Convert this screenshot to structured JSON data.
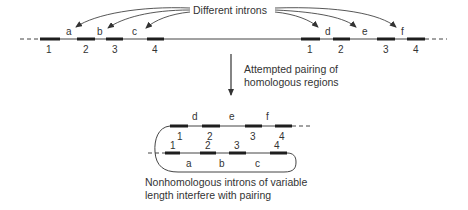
{
  "title_label": "Different introns",
  "step_arrow_text": [
    "Attempted pairing of",
    "homologous regions"
  ],
  "caption": [
    "Nonhomologous introns of variable",
    "length interfere with pairing"
  ],
  "gene_left": {
    "exons": [
      "1",
      "2",
      "3",
      "4"
    ],
    "introns": [
      "a",
      "b",
      "c"
    ]
  },
  "gene_right": {
    "exons": [
      "1",
      "2",
      "3",
      "4"
    ],
    "introns": [
      "d",
      "e",
      "f"
    ]
  },
  "paired_top": {
    "exons": [
      "1",
      "2",
      "3",
      "4"
    ],
    "introns": [
      "d",
      "e",
      "f"
    ]
  },
  "paired_bottom": {
    "exons": [
      "1",
      "2",
      "3",
      "4"
    ],
    "introns": [
      "a",
      "b",
      "c"
    ]
  },
  "colors": {
    "line": "#3a3a3a",
    "exon": "#1e1e1e",
    "text": "#333333"
  }
}
